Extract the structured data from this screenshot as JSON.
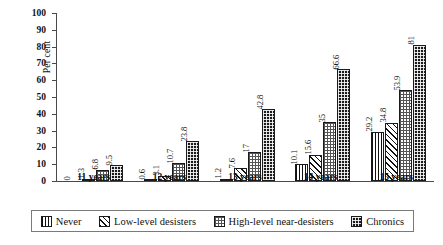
{
  "chart_data": {
    "type": "bar",
    "title": "",
    "subtitle": "",
    "xlabel": "",
    "ylabel": "Per cent",
    "ylim": [
      0,
      100
    ],
    "ytick_step": 10,
    "yticks": [
      0,
      10,
      20,
      30,
      40,
      50,
      60,
      70,
      80,
      90,
      100
    ],
    "grid": false,
    "legend_position": "bottom",
    "categories": [
      "11 years",
      "12 years",
      "13 years",
      "14 years",
      "15 years"
    ],
    "series": [
      {
        "name": "Never",
        "pattern": "vertical-lines",
        "values": [
          0,
          0.6,
          1.2,
          10.1,
          29.2
        ],
        "labels": [
          "0",
          "0.6",
          "1.2",
          "10.1",
          "29.2"
        ]
      },
      {
        "name": "Low-level desisters",
        "pattern": "diagonal-hatch",
        "values": [
          1.3,
          3.1,
          7.6,
          15.6,
          34.8
        ],
        "labels": [
          "1.3",
          "3.1",
          "7.6",
          "15.6",
          "34.8"
        ]
      },
      {
        "name": "High-level near-desisters",
        "pattern": "dotted-grid",
        "values": [
          6.8,
          10.7,
          17,
          35,
          53.9
        ],
        "labels": [
          "6.8",
          "10.7",
          "17",
          "35",
          "53.9"
        ]
      },
      {
        "name": "Chronics",
        "pattern": "dark-checker",
        "values": [
          9.5,
          23.8,
          42.8,
          66.6,
          81
        ],
        "labels": [
          "9.5",
          "23.8",
          "42.8",
          "66.6",
          "81"
        ]
      }
    ]
  },
  "legend": {
    "items": [
      {
        "label": "Never"
      },
      {
        "label": "Low-level desisters"
      },
      {
        "label": "High-level near-desisters"
      },
      {
        "label": "Chronics"
      }
    ]
  },
  "colors": {
    "axis": "#4a4a4a",
    "ink": "#111111",
    "chronic_fill": "#1b1b1b",
    "legend_border": "#7a7a7a",
    "background": "#ffffff"
  }
}
